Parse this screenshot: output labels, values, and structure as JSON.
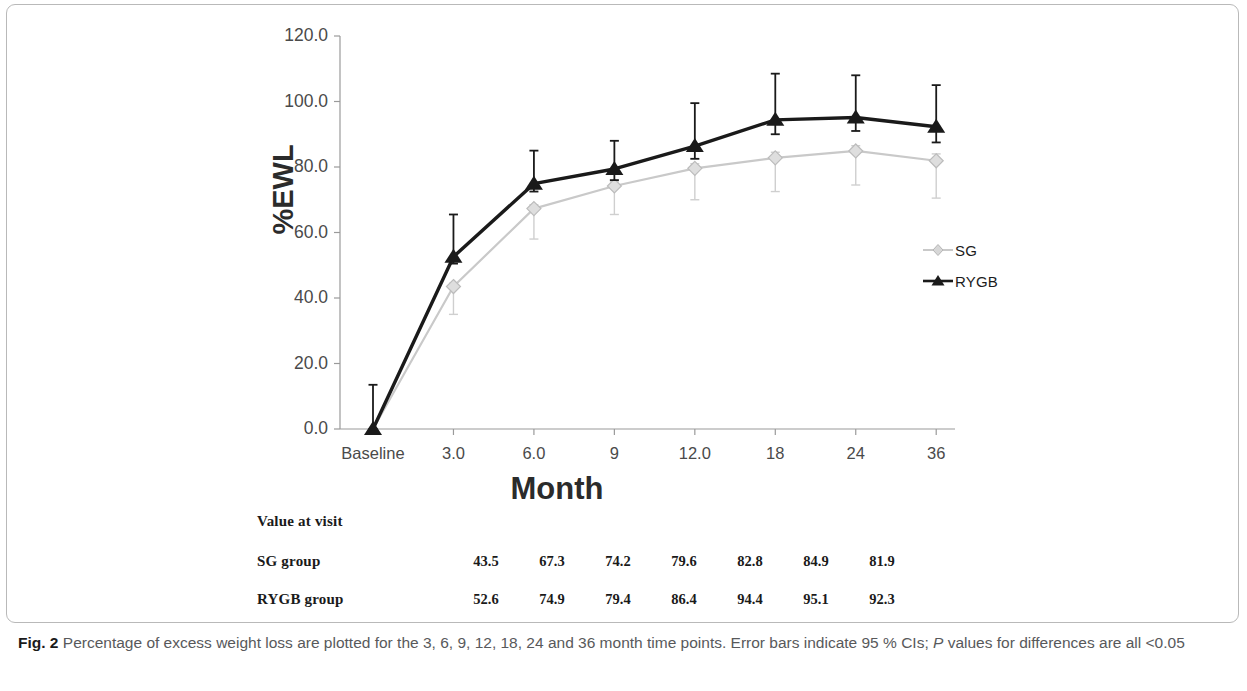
{
  "chart_data": {
    "type": "line",
    "title": "",
    "xlabel": "Month",
    "ylabel": "%EWL",
    "categories": [
      "Baseline",
      "3.0",
      "6.0",
      "9",
      "12.0",
      "18",
      "24",
      "36"
    ],
    "x_numeric": [
      0,
      3,
      6,
      9,
      12,
      18,
      24,
      36
    ],
    "ylim": [
      0,
      120
    ],
    "yticks": [
      "0.0",
      "20.0",
      "40.0",
      "60.0",
      "80.0",
      "100.0",
      "120.0"
    ],
    "ytick_values": [
      0,
      20,
      40,
      60,
      80,
      100,
      120
    ],
    "grid": false,
    "legend_position": "right",
    "error_bars": "95 % CI",
    "series": [
      {
        "name": "SG",
        "color": "#c9c9c9",
        "marker": "diamond",
        "values": [
          0,
          43.5,
          67.3,
          74.2,
          79.6,
          82.8,
          84.9,
          81.9
        ],
        "ci_low": [
          0,
          35.0,
          58.0,
          65.5,
          70.0,
          72.5,
          74.5,
          70.5
        ],
        "ci_high": [
          0,
          44.5,
          68.5,
          75.5,
          81.0,
          84.5,
          86.5,
          84.0
        ]
      },
      {
        "name": "RYGB",
        "color": "#1a1a1a",
        "marker": "triangle",
        "values": [
          0,
          52.6,
          74.9,
          79.4,
          86.4,
          94.4,
          95.1,
          92.3
        ],
        "ci_low": [
          0,
          50.5,
          72.5,
          76.0,
          82.5,
          90.0,
          91.0,
          87.5
        ],
        "ci_high": [
          13.5,
          65.5,
          85.0,
          88.0,
          99.5,
          108.5,
          108.0,
          105.0
        ]
      }
    ]
  },
  "legend": {
    "items": [
      {
        "label": "SG",
        "marker": "diamond",
        "color": "#c9c9c9"
      },
      {
        "label": "RYGB",
        "marker": "triangle",
        "color": "#1a1a1a"
      }
    ]
  },
  "value_table": {
    "title": "Value at visit",
    "rows": [
      {
        "label": "SG group",
        "values": [
          "43.5",
          "67.3",
          "74.2",
          "79.6",
          "82.8",
          "84.9",
          "81.9"
        ]
      },
      {
        "label": "RYGB group",
        "values": [
          "52.6",
          "74.9",
          "79.4",
          "86.4",
          "94.4",
          "95.1",
          "92.3"
        ]
      }
    ]
  },
  "caption": {
    "figure_number": "Fig. 2",
    "text": "Percentage of excess weight loss are plotted for the 3, 6, 9, 12, 18, 24 and 36 month time points. Error bars indicate 95 % CIs;",
    "italic_token": "P",
    "text_tail": "values for differences are all <0.05"
  }
}
